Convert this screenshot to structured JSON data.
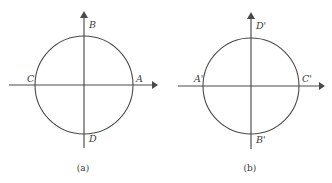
{
  "figure": {
    "type": "geometry-diagram",
    "stroke_color": "#4a4a4a",
    "label_color": "#3a3a3a",
    "background_color": "#ffffff",
    "panels": [
      {
        "id": "panel-a",
        "caption": "(a)",
        "circle": {
          "center_x": 84,
          "center_y": 85,
          "radius": 49
        },
        "axes": {
          "x_axis": {
            "x_start": 9,
            "x_end": 158,
            "y": 85,
            "arrow": "right"
          },
          "y_axis": {
            "x": 84,
            "y_start": 11,
            "y_end": 148,
            "arrow": "up"
          }
        },
        "points": [
          {
            "name": "A",
            "label": "A",
            "position": "right",
            "label_x": 136,
            "label_y": 74
          },
          {
            "name": "B",
            "label": "B",
            "position": "top",
            "label_x": 89,
            "label_y": 20
          },
          {
            "name": "C",
            "label": "C",
            "position": "left",
            "label_x": 27,
            "label_y": 74
          },
          {
            "name": "D",
            "label": "D",
            "position": "bottom",
            "label_x": 89,
            "label_y": 134
          }
        ]
      },
      {
        "id": "panel-b",
        "caption": "(b)",
        "circle": {
          "center_x": 251,
          "center_y": 86,
          "radius": 48
        },
        "axes": {
          "x_axis": {
            "x_start": 178,
            "x_end": 325,
            "y": 86,
            "arrow": "right"
          },
          "y_axis": {
            "x": 251,
            "y_start": 12,
            "y_end": 149,
            "arrow": "up"
          }
        },
        "points": [
          {
            "name": "A-prime",
            "label": "A'",
            "position": "left",
            "label_x": 194,
            "label_y": 74
          },
          {
            "name": "B-prime",
            "label": "B'",
            "position": "bottom",
            "label_x": 256,
            "label_y": 135
          },
          {
            "name": "C-prime",
            "label": "C'",
            "position": "right",
            "label_x": 302,
            "label_y": 74
          },
          {
            "name": "D-prime",
            "label": "D'",
            "position": "top",
            "label_x": 256,
            "label_y": 21
          }
        ]
      }
    ],
    "captions": [
      {
        "text": "(a)",
        "x": 83,
        "y": 164
      },
      {
        "text": "(b)",
        "x": 250,
        "y": 164
      }
    ]
  }
}
